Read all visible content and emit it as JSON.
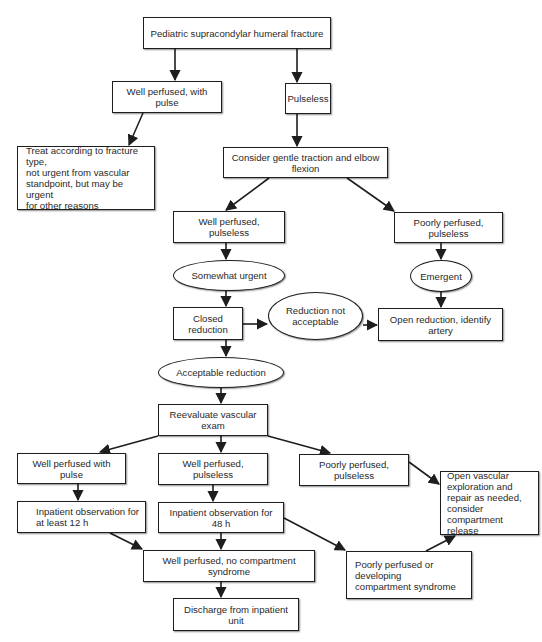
{
  "diagram": {
    "type": "flowchart",
    "nodes": {
      "root": "Pediatric supracondylar humeral fracture",
      "well_perfused_with_pulse_top": "Well perfused, with pulse",
      "pulseless": "Pulseless",
      "treat_according": "Treat according to fracture type,\nnot urgent from vascular\nstandpoint, but may be urgent\nfor other reasons",
      "consider_traction": "Consider gentle traction and elbow flexion",
      "well_perfused_pulseless_top": "Well perfused, pulseless",
      "poorly_perfused_pulseless_top": "Poorly perfused, pulseless",
      "somewhat_urgent": "Somewhat urgent",
      "emergent": "Emergent",
      "closed_reduction": "Closed reduction",
      "reduction_not_acceptable": "Reduction not\nacceptable",
      "open_reduction": "Open reduction, identify artery",
      "acceptable_reduction": "Acceptable reduction",
      "reevaluate": "Reevaluate vascular exam",
      "well_perfused_with_pulse_bottom": "Well perfused with pulse",
      "well_perfused_pulseless_bottom": "Well perfused, pulseless",
      "poorly_perfused_pulseless_bottom": "Poorly perfused, pulseless",
      "open_vascular": "Open vascular\nexploration and\nrepair as needed,\nconsider\ncompartment release",
      "observation_12h": "Inpatient observation for\nat least 12 h",
      "observation_48h": "Inpatient observation for 48 h",
      "no_compartment": "Well perfused, no compartment syndrome",
      "poorly_or_developing": "Poorly perfused or developing\ncompartment syndrome",
      "discharge": "Discharge from inpatient unit"
    },
    "edges": [
      [
        "root",
        "well_perfused_with_pulse_top"
      ],
      [
        "root",
        "pulseless"
      ],
      [
        "well_perfused_with_pulse_top",
        "treat_according"
      ],
      [
        "pulseless",
        "consider_traction"
      ],
      [
        "consider_traction",
        "well_perfused_pulseless_top"
      ],
      [
        "consider_traction",
        "poorly_perfused_pulseless_top"
      ],
      [
        "well_perfused_pulseless_top",
        "somewhat_urgent"
      ],
      [
        "poorly_perfused_pulseless_top",
        "emergent"
      ],
      [
        "somewhat_urgent",
        "closed_reduction"
      ],
      [
        "emergent",
        "open_reduction"
      ],
      [
        "closed_reduction",
        "reduction_not_acceptable"
      ],
      [
        "reduction_not_acceptable",
        "open_reduction"
      ],
      [
        "closed_reduction",
        "acceptable_reduction"
      ],
      [
        "acceptable_reduction",
        "reevaluate"
      ],
      [
        "reevaluate",
        "well_perfused_with_pulse_bottom"
      ],
      [
        "reevaluate",
        "well_perfused_pulseless_bottom"
      ],
      [
        "reevaluate",
        "poorly_perfused_pulseless_bottom"
      ],
      [
        "poorly_perfused_pulseless_bottom",
        "open_vascular"
      ],
      [
        "well_perfused_with_pulse_bottom",
        "observation_12h"
      ],
      [
        "well_perfused_pulseless_bottom",
        "observation_48h"
      ],
      [
        "observation_12h",
        "no_compartment"
      ],
      [
        "observation_48h",
        "no_compartment"
      ],
      [
        "observation_48h",
        "poorly_or_developing"
      ],
      [
        "poorly_or_developing",
        "open_vascular"
      ],
      [
        "no_compartment",
        "discharge"
      ]
    ],
    "colors": {
      "stroke": "#1e1e1e",
      "fill": "#ffffff",
      "text": "#2a2a2a"
    }
  }
}
